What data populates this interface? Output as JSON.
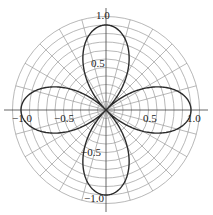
{
  "chart_data": {
    "type": "line",
    "subtype": "polar",
    "title": "",
    "equation": "r = cos(2θ)",
    "series": [
      {
        "name": "r = cos(2θ)",
        "description": "four-petal rose curve",
        "petal_tips": [
          {
            "x": 1.0,
            "y": 0.0
          },
          {
            "x": 0.0,
            "y": 1.0
          },
          {
            "x": -1.0,
            "y": 0.0
          },
          {
            "x": 0.0,
            "y": -1.0
          }
        ],
        "color": "#2b2b2b"
      }
    ],
    "x_tick_labels": [
      "-1.0",
      "-0.5",
      "0.5",
      "1.0"
    ],
    "y_tick_labels": [
      "1.0",
      "0.5",
      "-0.5",
      "-1.0"
    ],
    "xlabel": "",
    "ylabel": "",
    "xlim": [
      -1.1,
      1.1
    ],
    "ylim": [
      -1.1,
      1.1
    ],
    "grid": {
      "on": true,
      "radial_step_deg": 15,
      "circle_step": 0.1,
      "circle_max": 1.1,
      "color": "#9a9a9a"
    },
    "legend": null
  },
  "layout": {
    "cx": 106,
    "cy": 110,
    "unit_px": 85,
    "axis_extent_px": 102,
    "curve_color": "#2b2b2b",
    "grid_color": "#9a9a9a",
    "axis_color": "#555555"
  },
  "labels": [
    {
      "text": "1.0",
      "x": 96,
      "y": 19,
      "name": "y-tick-1.0"
    },
    {
      "text": "0.5",
      "x": 91,
      "y": 67,
      "name": "y-tick-0.5"
    },
    {
      "text": "−0.5",
      "x": 81,
      "y": 156,
      "name": "y-tick-neg-0.5"
    },
    {
      "text": "−1.0",
      "x": 84,
      "y": 202,
      "name": "y-tick-neg-1.0"
    },
    {
      "text": "−1.0",
      "x": 12,
      "y": 122,
      "name": "x-tick-neg-1.0"
    },
    {
      "text": "−0.5",
      "x": 54,
      "y": 122,
      "name": "x-tick-neg-0.5"
    },
    {
      "text": "0.5",
      "x": 143,
      "y": 122,
      "name": "x-tick-0.5"
    },
    {
      "text": "1.0",
      "x": 187,
      "y": 122,
      "name": "x-tick-1.0"
    }
  ]
}
